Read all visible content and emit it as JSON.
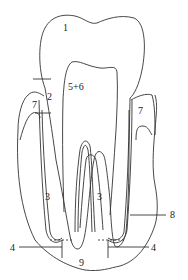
{
  "diagram": {
    "type": "tooth-cross-section",
    "labels": [
      {
        "id": "1",
        "text": "1",
        "x": 63,
        "y": 31
      },
      {
        "id": "2",
        "text": "2",
        "x": 47,
        "y": 100
      },
      {
        "id": "3a",
        "text": "3",
        "x": 45,
        "y": 200
      },
      {
        "id": "3b",
        "text": "3",
        "x": 97,
        "y": 200
      },
      {
        "id": "4a",
        "text": "4",
        "x": 10,
        "y": 251
      },
      {
        "id": "4b",
        "text": "4",
        "x": 151,
        "y": 251
      },
      {
        "id": "56",
        "text": "5+6",
        "x": 68,
        "y": 90
      },
      {
        "id": "7a",
        "text": "7",
        "x": 32,
        "y": 108
      },
      {
        "id": "7b",
        "text": "7",
        "x": 138,
        "y": 114
      },
      {
        "id": "8",
        "text": "8",
        "x": 170,
        "y": 218
      },
      {
        "id": "9",
        "text": "9",
        "x": 79,
        "y": 266
      }
    ]
  }
}
